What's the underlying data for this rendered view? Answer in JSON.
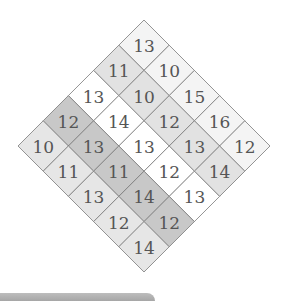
{
  "diagram": {
    "type": "rotated-grid",
    "size": 5,
    "geometry": {
      "apex_x": 144,
      "apex_y": 20,
      "half_diag": 25.2
    },
    "band_colors": [
      "#f4f4f4",
      "#e2e2e2",
      "#ffffff",
      "#c8c8c8",
      "#e6e6e6"
    ],
    "grid": [
      [
        13,
        11,
        13,
        12,
        10
      ],
      [
        10,
        10,
        14,
        13,
        11
      ],
      [
        15,
        12,
        13,
        11,
        13
      ],
      [
        16,
        13,
        12,
        14,
        12
      ],
      [
        12,
        14,
        13,
        12,
        14
      ]
    ],
    "rows_top_to_bottom": [
      [
        13
      ],
      [
        11,
        10
      ],
      [
        13,
        10,
        15
      ],
      [
        12,
        14,
        12,
        16
      ],
      [
        10,
        13,
        13,
        13,
        12
      ],
      [
        11,
        11,
        12,
        14
      ],
      [
        13,
        14,
        13
      ],
      [
        12,
        12
      ],
      [
        14
      ]
    ]
  },
  "bottom_bar": {
    "color": "#a8a8a8"
  }
}
